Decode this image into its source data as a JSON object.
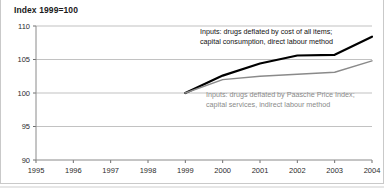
{
  "figure": {
    "title": "Index 1999=100",
    "background": "#ffffff",
    "border_color": "#c9c9c9"
  },
  "annotations": {
    "series_a_line1": "Inputs: drugs deflated by cost of all items;",
    "series_a_line2": "capital consumption, direct labour method",
    "series_b_line1": "Inputs: drugs deflated by Paasche Price Index;",
    "series_b_line2": "capital services, indirect labour method"
  },
  "axis": {
    "y_ticks": [
      "90",
      "95",
      "100",
      "105",
      "110"
    ],
    "x_ticks": [
      "1995",
      "1996",
      "1997",
      "1998",
      "1999",
      "2000",
      "2001",
      "2002",
      "2003",
      "2004"
    ]
  },
  "chart_data": {
    "type": "line",
    "title": "Index 1999=100",
    "xlabel": "",
    "ylabel": "",
    "xlim": [
      1995,
      2004
    ],
    "ylim": [
      90,
      110
    ],
    "grid": true,
    "legend_position": "inline-annotation",
    "x": [
      1995,
      1996,
      1997,
      1998,
      1999,
      2000,
      2001,
      2002,
      2003,
      2004
    ],
    "series": [
      {
        "name": "Inputs: drugs deflated by cost of all items; capital consumption, direct labour method",
        "color": "#000000",
        "width": 2.2,
        "x": [
          1999,
          2000,
          2001,
          2002,
          2003,
          2004
        ],
        "values": [
          100.0,
          102.6,
          104.4,
          105.6,
          105.7,
          108.4
        ]
      },
      {
        "name": "Inputs: drugs deflated by Paasche Price Index; capital services, indirect labour method",
        "color": "#8a8a8a",
        "width": 1.4,
        "x": [
          1999,
          2000,
          2001,
          2002,
          2003,
          2004
        ],
        "values": [
          100.0,
          102.0,
          102.5,
          102.8,
          103.1,
          104.8
        ]
      }
    ]
  }
}
